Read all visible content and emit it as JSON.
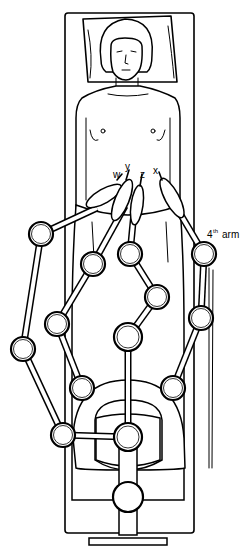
{
  "figure": {
    "ports": [
      {
        "id": "w",
        "label": "w"
      },
      {
        "id": "y",
        "label": "y"
      },
      {
        "id": "z",
        "label": "z"
      },
      {
        "id": "x",
        "label": "x"
      }
    ],
    "arm_label": {
      "ordinal": "4",
      "superscript": "th",
      "text": "arm"
    },
    "colors": {
      "line": "#000000",
      "background": "#ffffff"
    }
  }
}
